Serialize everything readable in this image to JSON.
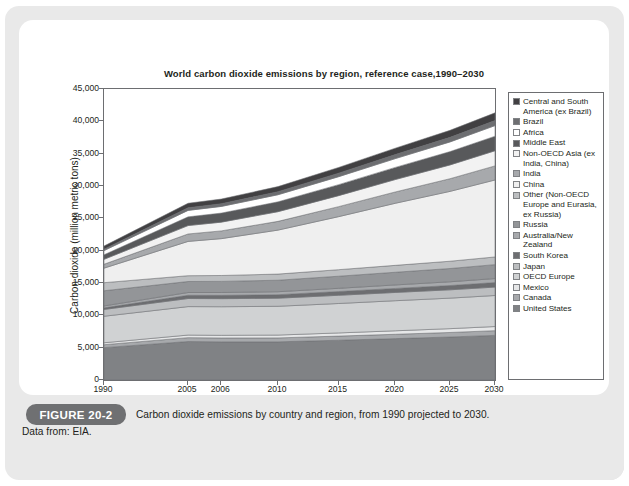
{
  "figure": {
    "tag": "FIGURE 20-2",
    "caption": "Carbon dioxide emissions by country and region, from 1990 projected to 2030.",
    "data_from": "Data from: EIA."
  },
  "chart_data": {
    "type": "area",
    "title": "World carbon dioxide emissions by region, reference case,1990–2030",
    "xlabel": "",
    "ylabel": "Carbon dioxide (million metric tons)",
    "x": [
      "1990",
      "2005",
      "2006",
      "2010",
      "2015",
      "2020",
      "2025",
      "2030"
    ],
    "xtick_labels": [
      "1990",
      "2005",
      "2006",
      "2010",
      "2015",
      "2020",
      "2025",
      "2030"
    ],
    "ytick_labels": [
      "0",
      "5,000",
      "10,000",
      "15,000",
      "20,000",
      "25,000",
      "30,000",
      "35,000",
      "40,000",
      "45,000"
    ],
    "ylim": [
      0,
      45000
    ],
    "ytick_step": 5000,
    "grid": false,
    "legend_position": "right",
    "stacked": true,
    "series": [
      {
        "name": "United States",
        "color": "#808285",
        "values": [
          5000,
          5950,
          5900,
          5900,
          6150,
          6400,
          6650,
          6900
        ]
      },
      {
        "name": "Canada",
        "color": "#a7a9ac",
        "values": [
          460,
          600,
          600,
          610,
          640,
          670,
          700,
          730
        ]
      },
      {
        "name": "Mexico",
        "color": "#e6e7e8",
        "values": [
          300,
          400,
          410,
          440,
          490,
          540,
          590,
          640
        ]
      },
      {
        "name": "OECD Europe",
        "color": "#d0d2d3",
        "values": [
          4100,
          4400,
          4420,
          4450,
          4550,
          4650,
          4720,
          4800
        ]
      },
      {
        "name": "Japan",
        "color": "#bcbec0",
        "values": [
          1050,
          1250,
          1250,
          1250,
          1270,
          1280,
          1290,
          1300
        ]
      },
      {
        "name": "South Korea",
        "color": "#6d6e71",
        "values": [
          250,
          500,
          510,
          540,
          580,
          620,
          660,
          700
        ]
      },
      {
        "name": "Australia/New Zealand",
        "color": "#a7a9ac",
        "values": [
          290,
          430,
          440,
          460,
          500,
          540,
          580,
          620
        ]
      },
      {
        "name": "Russia",
        "color": "#939598",
        "values": [
          2350,
          1700,
          1720,
          1780,
          1870,
          1960,
          2050,
          2150
        ]
      },
      {
        "name": "Other (Non-OECD Europe and Eurasia, ex Russia)",
        "color": "#bcbec0",
        "values": [
          1250,
          900,
          910,
          950,
          1010,
          1070,
          1130,
          1190
        ]
      },
      {
        "name": "China",
        "color": "#efefef",
        "values": [
          2250,
          5300,
          5700,
          6800,
          8200,
          9600,
          10800,
          11900
        ]
      },
      {
        "name": "India",
        "color": "#a7a9ac",
        "values": [
          600,
          1150,
          1200,
          1350,
          1550,
          1750,
          1960,
          2180
        ]
      },
      {
        "name": "Non-OECD Asia (ex India, China)",
        "color": "#f2f2f2",
        "values": [
          760,
          1300,
          1350,
          1500,
          1700,
          1920,
          2130,
          2340
        ]
      },
      {
        "name": "Middle East",
        "color": "#58595b",
        "values": [
          700,
          1350,
          1400,
          1520,
          1700,
          1880,
          2060,
          2250
        ]
      },
      {
        "name": "Africa",
        "color": "#ffffff",
        "values": [
          650,
          1000,
          1030,
          1100,
          1230,
          1360,
          1500,
          1640
        ]
      },
      {
        "name": "Brazil",
        "color": "#6d6e71",
        "values": [
          220,
          400,
          420,
          470,
          540,
          620,
          700,
          780
        ]
      },
      {
        "name": "Central and South America (ex Brazil)",
        "color": "#414042",
        "values": [
          480,
          700,
          720,
          790,
          890,
          990,
          1090,
          1190
        ]
      }
    ],
    "legend": [
      {
        "label": "Central and South America (ex Brazil)",
        "color": "#414042"
      },
      {
        "label": "Brazil",
        "color": "#6d6e71"
      },
      {
        "label": "Africa",
        "color": "#ffffff"
      },
      {
        "label": "Middle East",
        "color": "#58595b"
      },
      {
        "label": "Non-OECD Asia (ex India, China)",
        "color": "#f2f2f2"
      },
      {
        "label": "India",
        "color": "#a7a9ac"
      },
      {
        "label": "China",
        "color": "#efefef"
      },
      {
        "label": "Other (Non-OECD Europe and Eurasia, ex Russia)",
        "color": "#bcbec0"
      },
      {
        "label": "Russia",
        "color": "#939598"
      },
      {
        "label": "Australia/New Zealand",
        "color": "#a7a9ac"
      },
      {
        "label": "South Korea",
        "color": "#6d6e71"
      },
      {
        "label": "Japan",
        "color": "#bcbec0"
      },
      {
        "label": "OECD Europe",
        "color": "#d0d2d3"
      },
      {
        "label": "Mexico",
        "color": "#e6e7e8"
      },
      {
        "label": "Canada",
        "color": "#a7a9ac"
      },
      {
        "label": "United States",
        "color": "#808285"
      }
    ]
  }
}
